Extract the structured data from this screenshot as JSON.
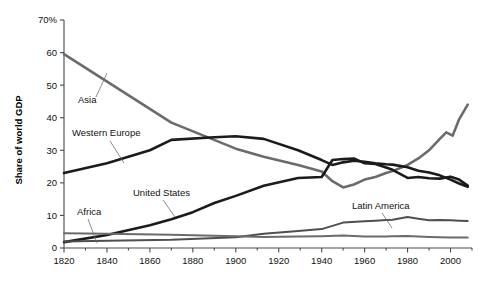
{
  "chart_data": {
    "type": "line",
    "title": "",
    "subtitle": "",
    "xlabel": "",
    "ylabel": "Share of world GDP",
    "xlim": [
      1820,
      2010
    ],
    "ylim": [
      0,
      70
    ],
    "grid": false,
    "legend_position": "inline-annotations",
    "y_tick_labels": [
      "0",
      "10",
      "20",
      "30",
      "40",
      "50",
      "60",
      "70%"
    ],
    "y_ticks": [
      0,
      10,
      20,
      30,
      40,
      50,
      60,
      70
    ],
    "x_tick_labels": [
      "1820",
      "1840",
      "1860",
      "1880",
      "1900",
      "1920",
      "1940",
      "1960",
      "1980",
      "2000"
    ],
    "x_ticks": [
      1820,
      1840,
      1860,
      1880,
      1900,
      1920,
      1940,
      1960,
      1980,
      2000
    ],
    "x_minor_ticks": [
      1830,
      1850,
      1870,
      1890,
      1910,
      1930,
      1950,
      1970,
      1990,
      2010
    ],
    "series": [
      {
        "name": "Asia",
        "color": "#6b6b6b",
        "x": [
          1820,
          1870,
          1900,
          1913,
          1929,
          1940,
          1945,
          1950,
          1955,
          1960,
          1965,
          1970,
          1973,
          1980,
          1985,
          1990,
          1995,
          1998,
          2001,
          2004,
          2008
        ],
        "values": [
          59.5,
          38.5,
          30.5,
          28.0,
          25.5,
          23.5,
          20.5,
          18.6,
          19.5,
          21.0,
          21.8,
          23.0,
          23.6,
          25.5,
          27.5,
          30.0,
          33.5,
          35.5,
          34.5,
          39.5,
          44.0
        ]
      },
      {
        "name": "Western Europe",
        "color": "#1b1b1b",
        "x": [
          1820,
          1840,
          1860,
          1870,
          1890,
          1900,
          1913,
          1929,
          1940,
          1945,
          1950,
          1955,
          1960,
          1965,
          1970,
          1973,
          1980,
          1985,
          1990,
          1995,
          2000,
          2004,
          2008
        ],
        "values": [
          23.0,
          26.0,
          30.0,
          33.2,
          34.0,
          34.3,
          33.5,
          30.0,
          27.0,
          25.5,
          26.3,
          26.8,
          26.5,
          26.0,
          25.7,
          25.6,
          24.8,
          23.7,
          23.2,
          22.3,
          21.0,
          19.8,
          18.8
        ]
      },
      {
        "name": "United States",
        "color": "#1b1b1b",
        "x": [
          1820,
          1840,
          1860,
          1870,
          1880,
          1890,
          1900,
          1913,
          1929,
          1940,
          1945,
          1950,
          1955,
          1960,
          1965,
          1970,
          1973,
          1980,
          1985,
          1990,
          1995,
          2000,
          2004,
          2008
        ],
        "values": [
          1.8,
          4.0,
          7.0,
          8.8,
          11.0,
          13.8,
          16.0,
          19.1,
          21.5,
          21.8,
          27.0,
          27.3,
          27.5,
          26.0,
          25.8,
          24.7,
          24.0,
          21.5,
          21.8,
          21.4,
          21.3,
          21.9,
          21.0,
          19.2
        ]
      },
      {
        "name": "Latin America",
        "color": "#4f4f4f",
        "x": [
          1820,
          1840,
          1870,
          1900,
          1913,
          1929,
          1940,
          1950,
          1960,
          1965,
          1970,
          1973,
          1980,
          1985,
          1990,
          1995,
          2000,
          2004,
          2008
        ],
        "values": [
          2.0,
          2.2,
          2.5,
          3.3,
          4.4,
          5.2,
          5.8,
          7.8,
          8.2,
          8.4,
          8.6,
          8.7,
          9.5,
          9.0,
          8.5,
          8.6,
          8.5,
          8.4,
          8.3
        ]
      },
      {
        "name": "Africa",
        "color": "#6b6b6b",
        "x": [
          1820,
          1840,
          1870,
          1900,
          1913,
          1929,
          1940,
          1950,
          1960,
          1970,
          1973,
          1980,
          1990,
          2000,
          2008
        ],
        "values": [
          4.5,
          4.4,
          4.1,
          3.6,
          3.4,
          3.5,
          3.6,
          3.8,
          3.5,
          3.5,
          3.6,
          3.7,
          3.4,
          3.2,
          3.2
        ]
      }
    ],
    "annotations": [
      {
        "label": "Asia",
        "text_x": 78,
        "text_y": 103,
        "leader": [
          [
            96,
            97
          ],
          [
            107,
            73
          ]
        ]
      },
      {
        "label": "Western Europe",
        "text_x": 72,
        "text_y": 136,
        "leader": [
          [
            110,
            141
          ],
          [
            124,
            163
          ]
        ]
      },
      {
        "label": "United States",
        "text_x": 133,
        "text_y": 196,
        "leader": [
          [
            163,
            200
          ],
          [
            175,
            217
          ]
        ]
      },
      {
        "label": "Africa",
        "text_x": 77,
        "text_y": 215,
        "leader": [
          [
            88,
            219
          ],
          [
            97,
            243
          ]
        ]
      },
      {
        "label": "Latin America",
        "text_x": 352,
        "text_y": 209,
        "leader": [
          [
            382,
            213
          ],
          [
            392,
            228
          ]
        ]
      }
    ]
  }
}
